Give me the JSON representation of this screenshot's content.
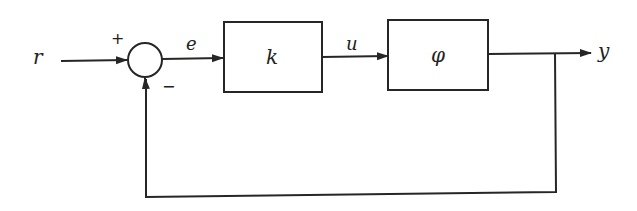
{
  "diagram": {
    "type": "feedback-control-block-diagram",
    "signals": {
      "input": "r",
      "error": "e",
      "control": "u",
      "output": "y"
    },
    "summing_junction": {
      "plus_sign": "+",
      "minus_sign": "−"
    },
    "blocks": [
      {
        "id": "controller",
        "label": "k"
      },
      {
        "id": "plant",
        "label": "φ"
      }
    ],
    "connections": [
      [
        "r",
        "summing_junction"
      ],
      [
        "summing_junction",
        "controller"
      ],
      [
        "controller",
        "plant"
      ],
      [
        "plant",
        "y"
      ],
      [
        "y",
        "summing_junction (feedback, negative)"
      ]
    ],
    "colors": {
      "line": "#262626",
      "background": "#ffffff"
    }
  }
}
